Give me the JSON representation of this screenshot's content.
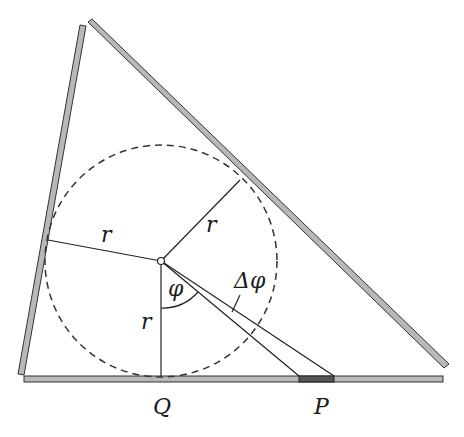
{
  "diagram": {
    "labels": {
      "r_left": "r",
      "r_upper": "r",
      "r_vertical": "r",
      "phi": "φ",
      "delta_phi": "Δφ",
      "Q": "Q",
      "P": "P"
    },
    "colors": {
      "wall_fill": "#b8b8b8",
      "wall_stroke": "#333333",
      "segment_fill": "#555555",
      "line": "#222222"
    }
  }
}
